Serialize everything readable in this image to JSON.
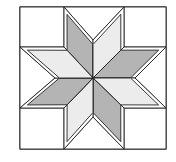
{
  "title": "",
  "figure": {
    "type": "quilt-block",
    "pattern": "eight-pointed star (LeMoyne star)",
    "points": 8,
    "colors": {
      "background": "#ffffff",
      "outline": "#222222",
      "dark_diamond": "#b4b4b4",
      "light_diamond": "#ececec",
      "border_band": "#ffffff"
    },
    "frame": {
      "x": 20,
      "y": 7,
      "width": 146,
      "height": 142
    },
    "center": [
      93,
      78
    ],
    "corner_squares": [
      {
        "name": "top-left",
        "points": [
          [
            20,
            7
          ],
          [
            64,
            7
          ],
          [
            64,
            47
          ],
          [
            20,
            47
          ]
        ]
      },
      {
        "name": "top-right",
        "points": [
          [
            124,
            7
          ],
          [
            166,
            7
          ],
          [
            166,
            47
          ],
          [
            124,
            47
          ]
        ]
      },
      {
        "name": "bottom-right",
        "points": [
          [
            124,
            108
          ],
          [
            166,
            108
          ],
          [
            166,
            149
          ],
          [
            124,
            149
          ]
        ]
      },
      {
        "name": "bottom-left",
        "points": [
          [
            20,
            108
          ],
          [
            64,
            108
          ],
          [
            64,
            149
          ],
          [
            20,
            149
          ]
        ]
      }
    ],
    "side_triangles": [
      {
        "name": "top",
        "points": [
          [
            64,
            7
          ],
          [
            124,
            7
          ],
          [
            93,
            40
          ]
        ]
      },
      {
        "name": "right",
        "points": [
          [
            166,
            47
          ],
          [
            166,
            108
          ],
          [
            135,
            78
          ]
        ]
      },
      {
        "name": "bottom",
        "points": [
          [
            124,
            149
          ],
          [
            64,
            149
          ],
          [
            93,
            117
          ]
        ]
      },
      {
        "name": "left",
        "points": [
          [
            20,
            108
          ],
          [
            20,
            47
          ],
          [
            55,
            78
          ]
        ]
      }
    ],
    "diamonds": [
      {
        "name": "up-left",
        "shade": "dark",
        "points": [
          [
            93,
            78
          ],
          [
            64,
            47
          ],
          [
            64,
            7
          ],
          [
            93,
            40
          ]
        ]
      },
      {
        "name": "up-right",
        "shade": "light",
        "points": [
          [
            93,
            78
          ],
          [
            93,
            40
          ],
          [
            124,
            7
          ],
          [
            124,
            47
          ]
        ]
      },
      {
        "name": "right-up",
        "shade": "dark",
        "points": [
          [
            93,
            78
          ],
          [
            124,
            47
          ],
          [
            166,
            47
          ],
          [
            135,
            78
          ]
        ]
      },
      {
        "name": "right-down",
        "shade": "light",
        "points": [
          [
            93,
            78
          ],
          [
            135,
            78
          ],
          [
            166,
            108
          ],
          [
            124,
            108
          ]
        ]
      },
      {
        "name": "down-right",
        "shade": "dark",
        "points": [
          [
            93,
            78
          ],
          [
            124,
            108
          ],
          [
            124,
            149
          ],
          [
            93,
            117
          ]
        ]
      },
      {
        "name": "down-left",
        "shade": "light",
        "points": [
          [
            93,
            78
          ],
          [
            93,
            117
          ],
          [
            64,
            149
          ],
          [
            64,
            108
          ]
        ]
      },
      {
        "name": "left-down",
        "shade": "dark",
        "points": [
          [
            93,
            78
          ],
          [
            64,
            108
          ],
          [
            20,
            108
          ],
          [
            55,
            78
          ]
        ]
      },
      {
        "name": "left-up",
        "shade": "light",
        "points": [
          [
            93,
            78
          ],
          [
            55,
            78
          ],
          [
            20,
            47
          ],
          [
            64,
            47
          ]
        ]
      }
    ],
    "border_band_width": 5
  }
}
